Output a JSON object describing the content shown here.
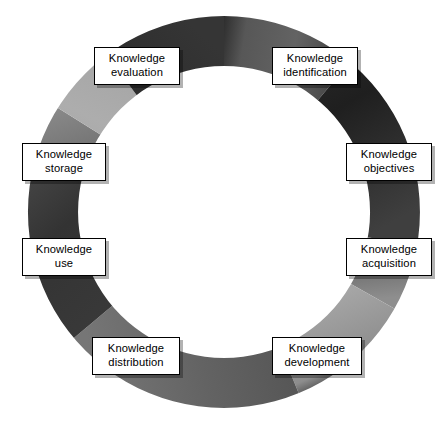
{
  "diagram": {
    "type": "cycle-ring-diagram",
    "background_color": "#ffffff",
    "ring": {
      "center_x": 224,
      "center_y": 212,
      "outer_radius": 196,
      "inner_radius": 146,
      "description": "Closed gray annulus with gradient shading from light gray to near-black",
      "colors": {
        "lightest": "#b3b3b3",
        "light": "#9a9a9a",
        "mid": "#6e6e6e",
        "dark": "#4a4a4a",
        "darkest": "#232323"
      },
      "segments": [
        {
          "name": "top-arc",
          "from_deg": 270,
          "to_deg": 310,
          "shade": "#5a5a5a"
        },
        {
          "name": "upper-right-arc",
          "from_deg": 310,
          "to_deg": 10,
          "shade": "#262626"
        },
        {
          "name": "right-arc",
          "from_deg": 10,
          "to_deg": 50,
          "shade": "#4f4f4f"
        },
        {
          "name": "lower-right-arc",
          "from_deg": 50,
          "to_deg": 90,
          "shade": "#9e9e9e"
        },
        {
          "name": "bottom-arc",
          "from_deg": 90,
          "to_deg": 140,
          "shade": "#5c5c5c"
        },
        {
          "name": "lower-left-arc",
          "from_deg": 140,
          "to_deg": 195,
          "shade": "#3a3a3a"
        },
        {
          "name": "left-arc",
          "from_deg": 195,
          "to_deg": 230,
          "shade": "#6b6b6b"
        },
        {
          "name": "upper-left-arc",
          "from_deg": 230,
          "to_deg": 262,
          "shade": "#a8a8a8"
        },
        {
          "name": "top-left-dark-wedge",
          "from_deg": 262,
          "to_deg": 272,
          "shade": "#2b2b2b"
        }
      ]
    },
    "nodes": [
      {
        "id": "knowledge-identification",
        "line1": "Knowledge",
        "line2": "identification",
        "x": 272,
        "y": 47,
        "width": 86,
        "height": 38,
        "angle_deg": 305
      },
      {
        "id": "knowledge-objectives",
        "line1": "Knowledge",
        "line2": "objectives",
        "x": 346,
        "y": 143,
        "width": 86,
        "height": 38,
        "angle_deg": 340
      },
      {
        "id": "knowledge-acquisition",
        "line1": "Knowledge",
        "line2": "acquisition",
        "x": 346,
        "y": 238,
        "width": 86,
        "height": 38,
        "angle_deg": 20
      },
      {
        "id": "knowledge-development",
        "line1": "Knowledge",
        "line2": "development",
        "x": 272,
        "y": 337,
        "width": 90,
        "height": 38,
        "angle_deg": 58
      },
      {
        "id": "knowledge-distribution",
        "line1": "Knowledge",
        "line2": "distribution",
        "x": 92,
        "y": 337,
        "width": 88,
        "height": 38,
        "angle_deg": 122
      },
      {
        "id": "knowledge-use",
        "line1": "Knowledge",
        "line2": "use",
        "x": 22,
        "y": 238,
        "width": 84,
        "height": 38,
        "angle_deg": 160
      },
      {
        "id": "knowledge-storage",
        "line1": "Knowledge",
        "line2": "storage",
        "x": 22,
        "y": 143,
        "width": 84,
        "height": 38,
        "angle_deg": 200
      },
      {
        "id": "knowledge-evaluation",
        "line1": "Knowledge",
        "line2": "evaluation",
        "x": 94,
        "y": 47,
        "width": 86,
        "height": 38,
        "angle_deg": 238
      }
    ]
  }
}
